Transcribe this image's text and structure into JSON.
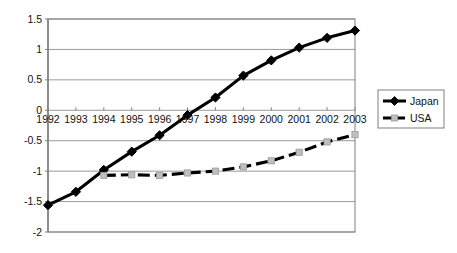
{
  "chart_data": {
    "type": "line",
    "title": "",
    "subtitle": "",
    "xlabel": "",
    "ylabel": "",
    "grid": true,
    "legend_position": "right",
    "categories": [
      "1992",
      "1993",
      "1994",
      "1995",
      "1996",
      "1997",
      "1998",
      "1999",
      "2000",
      "2001",
      "2002",
      "2003"
    ],
    "x": [
      1992,
      1993,
      1994,
      1995,
      1996,
      1997,
      1998,
      1999,
      2000,
      2001,
      2002,
      2003
    ],
    "ylim": [
      -2,
      1.5
    ],
    "ytick_labels": [
      "1.5",
      "1",
      "0.5",
      "0",
      "-0.5",
      "-1",
      "-1.5",
      "-2"
    ],
    "ytick_values": [
      1.5,
      1,
      0.5,
      0,
      -0.5,
      -1,
      -1.5,
      -2
    ],
    "xtick_labels": [
      "1992",
      "1993",
      "1994",
      "1995",
      "1996",
      "1997",
      "1998",
      "1999",
      "2000",
      "2001",
      "2002",
      "2003"
    ],
    "series": [
      {
        "name": "Japan",
        "marker": "diamond",
        "line_style": "solid",
        "color": "#000000",
        "values": [
          -1.56,
          -1.34,
          -0.98,
          -0.68,
          -0.41,
          -0.08,
          0.21,
          0.57,
          0.82,
          1.03,
          1.19,
          1.31
        ]
      },
      {
        "name": "USA",
        "marker": "square",
        "line_style": "dashed",
        "color": "#000000",
        "marker_color": "#bfbfbf",
        "values": [
          null,
          null,
          -1.07,
          -1.06,
          -1.07,
          -1.03,
          -1.0,
          -0.93,
          -0.83,
          -0.69,
          -0.52,
          -0.4
        ]
      }
    ]
  },
  "legend": {
    "items": [
      {
        "label": "Japan"
      },
      {
        "label": "USA"
      }
    ]
  },
  "colors": {
    "plot_border": "#808080",
    "gridline": "#999999",
    "axis": "#808080",
    "series_line": "#000000",
    "usa_marker": "#c0c0c0",
    "background": "#ffffff",
    "text": "#111111"
  }
}
